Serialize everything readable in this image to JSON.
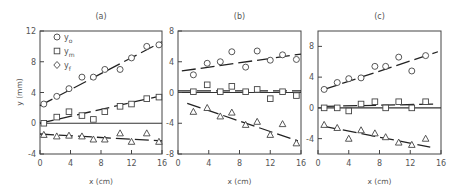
{
  "figure": {
    "ylabel": "y (mm)",
    "xlabel": "x (cm)",
    "legend": [
      {
        "symbol": "circle",
        "label": "y",
        "sub": "o"
      },
      {
        "symbol": "square",
        "label": "y",
        "sub": "m"
      },
      {
        "symbol": "diamond",
        "label": "y",
        "sub": "f"
      }
    ]
  },
  "chart_data": [
    {
      "type": "scatter",
      "title": "(a)",
      "xlabel": "x (cm)",
      "ylabel": "y (mm)",
      "xlim": [
        0,
        16
      ],
      "ylim": [
        -4,
        12
      ],
      "xticks": [
        0,
        4,
        8,
        12,
        16
      ],
      "yticks": [
        -4,
        0,
        4,
        8,
        12
      ],
      "legend": [
        "y_o",
        "y_m",
        "y_f"
      ],
      "series": [
        {
          "name": "y_o",
          "marker": "circle",
          "x": [
            0.5,
            2.2,
            3.8,
            5.5,
            7.0,
            8.5,
            10.5,
            12.0,
            14.0,
            15.6
          ],
          "y": [
            2.5,
            3.5,
            4.5,
            6.0,
            6.0,
            7.0,
            7.0,
            8.5,
            10.0,
            10.2
          ],
          "fit": [
            [
              0,
              2.3
            ],
            [
              16,
              10.6
            ]
          ]
        },
        {
          "name": "y_m",
          "marker": "square",
          "x": [
            0.5,
            2.2,
            3.8,
            5.5,
            7.0,
            8.5,
            10.5,
            12.0,
            14.0,
            15.6
          ],
          "y": [
            0.0,
            0.8,
            1.5,
            1.0,
            0.5,
            1.5,
            2.2,
            2.5,
            3.2,
            3.4
          ],
          "fit": [
            [
              0,
              0.0
            ],
            [
              16,
              3.6
            ]
          ]
        },
        {
          "name": "y_f",
          "marker": "triangle",
          "x": [
            0.5,
            2.2,
            3.8,
            5.5,
            7.0,
            8.5,
            10.5,
            12.0,
            14.0,
            15.6
          ],
          "y": [
            -1.5,
            -1.7,
            -1.6,
            -1.7,
            -2.1,
            -2.1,
            -1.3,
            -2.4,
            -1.3,
            -2.4
          ],
          "fit": [
            [
              0,
              -1.4
            ],
            [
              16,
              -2.3
            ]
          ]
        }
      ]
    },
    {
      "type": "scatter",
      "title": "(b)",
      "xlabel": "x (cm)",
      "ylabel": "",
      "xlim": [
        0,
        16
      ],
      "ylim": [
        -8,
        8
      ],
      "xticks": [
        0,
        4,
        8,
        12,
        16
      ],
      "yticks": [
        -8,
        -4,
        0,
        4,
        8
      ],
      "series": [
        {
          "name": "y_o",
          "marker": "circle",
          "x": [
            2.0,
            3.8,
            5.5,
            7.0,
            8.8,
            10.3,
            12.0,
            13.6,
            15.4
          ],
          "y": [
            2.3,
            3.8,
            4.0,
            5.3,
            3.3,
            5.4,
            4.2,
            4.9,
            4.3
          ],
          "fit": [
            [
              0.5,
              2.8
            ],
            [
              16,
              5.0
            ]
          ]
        },
        {
          "name": "y_m",
          "marker": "square",
          "x": [
            2.0,
            3.8,
            5.5,
            7.0,
            8.8,
            10.3,
            12.0,
            13.6,
            15.4
          ],
          "y": [
            0.1,
            1.0,
            0.1,
            0.8,
            0.1,
            0.4,
            -0.8,
            0.1,
            -0.4
          ],
          "fit": [
            [
              0,
              0.2
            ],
            [
              16,
              0.2
            ]
          ]
        },
        {
          "name": "y_f",
          "marker": "triangle",
          "x": [
            2.0,
            3.8,
            5.5,
            7.0,
            8.8,
            10.3,
            12.0,
            13.6,
            15.4
          ],
          "y": [
            -2.5,
            -2.0,
            -3.1,
            -2.6,
            -4.2,
            -3.8,
            -5.5,
            -4.1,
            -6.6
          ],
          "fit": [
            [
              1.2,
              -1.4
            ],
            [
              15.6,
              -6.3
            ]
          ]
        }
      ]
    },
    {
      "type": "scatter",
      "title": "(c)",
      "xlabel": "x (cm)",
      "ylabel": "",
      "xlim": [
        0,
        16
      ],
      "ylim": [
        -6,
        10
      ],
      "xticks": [
        0,
        4,
        8,
        12,
        16
      ],
      "yticks": [
        -4,
        0,
        4,
        8
      ],
      "series": [
        {
          "name": "y_o",
          "marker": "circle",
          "x": [
            0.8,
            2.5,
            4.0,
            5.6,
            7.4,
            8.8,
            10.5,
            12.2,
            14.0
          ],
          "y": [
            2.4,
            3.3,
            3.8,
            3.9,
            5.4,
            5.4,
            6.6,
            4.8,
            6.8
          ],
          "fit": [
            [
              0.8,
              2.4
            ],
            [
              15.6,
              7.3
            ]
          ]
        },
        {
          "name": "y_m",
          "marker": "square",
          "x": [
            0.8,
            2.5,
            4.0,
            5.6,
            7.4,
            8.8,
            10.5,
            12.2,
            14.0
          ],
          "y": [
            0.0,
            0.0,
            -0.4,
            0.5,
            0.8,
            0.0,
            0.8,
            0.0,
            0.8
          ],
          "fit": [
            [
              0.8,
              0.2
            ],
            [
              15.6,
              0.5
            ]
          ]
        },
        {
          "name": "y_f",
          "marker": "triangle",
          "x": [
            0.8,
            2.5,
            4.0,
            5.6,
            7.4,
            8.8,
            10.5,
            12.2,
            14.0
          ],
          "y": [
            -2.2,
            -2.6,
            -4.0,
            -2.9,
            -3.3,
            -3.8,
            -4.5,
            -4.8,
            -4.0
          ],
          "fit": [
            [
              0.8,
              -2.4
            ],
            [
              14.6,
              -5.1
            ]
          ]
        }
      ]
    }
  ]
}
